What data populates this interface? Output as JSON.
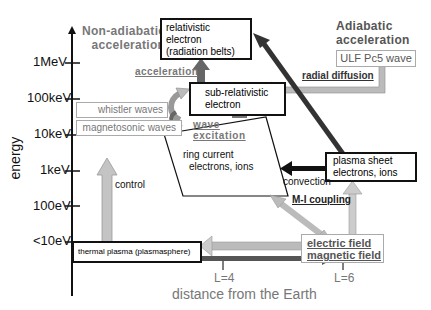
{
  "axes": {
    "y_label": "energy",
    "x_label": "distance from the Earth",
    "y_ticks": [
      "1MeV",
      "100keV",
      "10keV",
      "1keV",
      "100eV",
      "<10eV"
    ],
    "x_ticks": [
      "L=4",
      "L=6"
    ]
  },
  "headings": {
    "non_adiabatic": [
      "Non-adiabatic",
      "acceleration"
    ],
    "adiabatic": [
      "Adiabatic",
      "acceleration"
    ]
  },
  "boxes": {
    "relativistic": [
      "relativistic",
      "electron",
      "(radiation belts)"
    ],
    "sub_relativistic": [
      "sub-relativistic",
      "electron"
    ],
    "whistler": "whistler waves",
    "magnetosonic": "magnetosonic waves",
    "ulf": "ULF Pc5 wave",
    "plasma_sheet": [
      "plasma sheet",
      "electrons, ions"
    ],
    "thermal": "thermal plasma (plasmasphere)",
    "fields": [
      "electric field",
      "magnetic field"
    ]
  },
  "labels": {
    "acceleration": "acceleration",
    "wave_excitation": [
      "wave",
      "excitation"
    ],
    "ring_current": [
      "ring current",
      "electrons, ions"
    ],
    "radial_diffusion": "radial diffusion",
    "convection": "convection",
    "mi_coupling": "M-I coupling",
    "control": "control"
  },
  "colors": {
    "arrow_gray": "#b8b8b8",
    "arrow_dark": "#555555",
    "text_gray": "#777777",
    "black": "#111111"
  }
}
